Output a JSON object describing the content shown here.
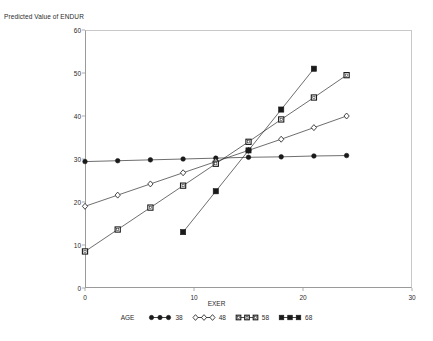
{
  "axes": {
    "y_title": "Predicted Value of ENDUR",
    "x_title": "EXER",
    "y_ticks": [
      "0",
      "10",
      "20",
      "30",
      "40",
      "50",
      "60"
    ],
    "x_ticks": [
      "0",
      "10",
      "20",
      "30"
    ]
  },
  "legend": {
    "title": "AGE",
    "entries": [
      {
        "value": "38",
        "marker": "filled-circle-marker",
        "color": "#1a1a1a"
      },
      {
        "value": "48",
        "marker": "open-diamond-marker",
        "color": "#1a1a1a"
      },
      {
        "value": "58",
        "marker": "open-square-marker",
        "color": "#1a1a1a"
      },
      {
        "value": "68",
        "marker": "filled-square-marker",
        "color": "#1a1a1a"
      }
    ]
  },
  "chart_data": {
    "type": "line",
    "title": "",
    "xlabel": "EXER",
    "ylabel": "Predicted Value of ENDUR",
    "xlim": [
      0,
      30
    ],
    "ylim": [
      0,
      60
    ],
    "xticks": [
      0,
      10,
      20,
      30
    ],
    "yticks": [
      0,
      10,
      20,
      30,
      40,
      50,
      60
    ],
    "grid": false,
    "legend_position": "bottom",
    "legend_title": "AGE",
    "series": [
      {
        "name": "38",
        "marker": "filled-circle",
        "color": "#1a1a1a",
        "x": [
          0,
          3,
          6,
          9,
          12,
          15,
          18,
          21,
          24
        ],
        "y": [
          29.4,
          29.6,
          29.8,
          30.0,
          30.2,
          30.4,
          30.5,
          30.7,
          30.8
        ]
      },
      {
        "name": "48",
        "marker": "open-diamond",
        "color": "#1a1a1a",
        "x": [
          0,
          3,
          6,
          9,
          12,
          15,
          18,
          21,
          24
        ],
        "y": [
          19.0,
          21.6,
          24.2,
          26.8,
          29.4,
          32.0,
          34.6,
          37.3,
          40.0
        ]
      },
      {
        "name": "58",
        "marker": "open-square",
        "color": "#1a1a1a",
        "x": [
          0,
          3,
          6,
          9,
          12,
          15,
          18,
          21,
          24
        ],
        "y": [
          8.5,
          13.6,
          18.7,
          23.8,
          28.9,
          34.0,
          39.2,
          44.3,
          49.5
        ]
      },
      {
        "name": "68",
        "marker": "filled-square",
        "color": "#1a1a1a",
        "x": [
          9,
          12,
          15,
          18,
          21
        ],
        "y": [
          13.0,
          22.5,
          32.0,
          41.5,
          51.0
        ]
      }
    ]
  }
}
